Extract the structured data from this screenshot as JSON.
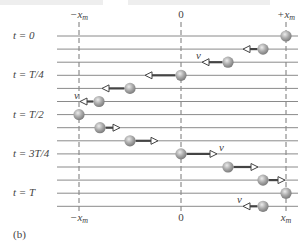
{
  "figure_label": "(b)",
  "colors": {
    "line": "#8a8a8a",
    "dashed": "#777777",
    "arrow": "#444444",
    "ball_light": "#e6e6e6",
    "ball_mid": "#a8a8a8",
    "ball_dark": "#7a7a7a",
    "text": "#444444"
  },
  "axis": {
    "top_labels": [
      {
        "text": "−x",
        "sub": "m",
        "pos": "neg"
      },
      {
        "text": "0",
        "sub": "",
        "pos": "zero"
      },
      {
        "text": "+x",
        "sub": "m",
        "pos": "pos"
      }
    ],
    "bottom_labels": [
      {
        "text": "−x",
        "sub": "m",
        "pos": "neg"
      },
      {
        "text": "0",
        "sub": "",
        "pos": "zero"
      },
      {
        "text": "x",
        "sub": "m",
        "pos": "pos"
      }
    ]
  },
  "time_labels": [
    {
      "text": "t = 0",
      "row": 0
    },
    {
      "text": "t = T/4",
      "row": 3
    },
    {
      "text": "t = T/2",
      "row": 6
    },
    {
      "text": "t = 3T/4",
      "row": 9
    },
    {
      "text": "t = T",
      "row": 12
    }
  ],
  "velocity_symbol": "v⃗",
  "rows": [
    {
      "ball_x": 286,
      "arrow_tip": null,
      "dir": 0,
      "v_label": false
    },
    {
      "ball_x": 263,
      "arrow_tip": 243,
      "dir": -1,
      "v_label": false
    },
    {
      "ball_x": 228,
      "arrow_tip": 202,
      "dir": -1,
      "v_label": true
    },
    {
      "ball_x": 181,
      "arrow_tip": 145,
      "dir": -1,
      "v_label": false
    },
    {
      "ball_x": 130,
      "arrow_tip": 102,
      "dir": -1,
      "v_label": false
    },
    {
      "ball_x": 99,
      "arrow_tip": 80,
      "dir": -1,
      "v_label": true
    },
    {
      "ball_x": 79,
      "arrow_tip": null,
      "dir": 0,
      "v_label": false
    },
    {
      "ball_x": 100,
      "arrow_tip": 120,
      "dir": 1,
      "v_label": false
    },
    {
      "ball_x": 130,
      "arrow_tip": 158,
      "dir": 1,
      "v_label": false
    },
    {
      "ball_x": 181,
      "arrow_tip": 217,
      "dir": 1,
      "v_label": true
    },
    {
      "ball_x": 228,
      "arrow_tip": 258,
      "dir": 1,
      "v_label": false
    },
    {
      "ball_x": 263,
      "arrow_tip": 285,
      "dir": 1,
      "v_label": false
    },
    {
      "ball_x": 286,
      "arrow_tip": null,
      "dir": 0,
      "v_label": false
    },
    {
      "ball_x": 263,
      "arrow_tip": 243,
      "dir": -1,
      "v_label": true
    }
  ]
}
